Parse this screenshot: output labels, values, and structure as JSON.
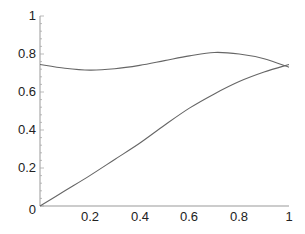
{
  "chart_data": {
    "type": "line",
    "title": "",
    "xlabel": "",
    "ylabel": "",
    "xlim": [
      0,
      1
    ],
    "ylim": [
      0,
      1
    ],
    "grid": false,
    "legend": null,
    "x_ticks": [
      "0.2",
      "0.4",
      "0.6",
      "0.8",
      "1"
    ],
    "y_ticks": [
      "0",
      "0.2",
      "0.4",
      "0.6",
      "0.8",
      "1"
    ],
    "x": [
      0,
      0.1,
      0.2,
      0.3,
      0.4,
      0.5,
      0.6,
      0.7,
      0.8,
      0.9,
      1.0
    ],
    "series": [
      {
        "name": "upper curve",
        "values": [
          0.745,
          0.725,
          0.715,
          0.722,
          0.74,
          0.765,
          0.79,
          0.808,
          0.8,
          0.775,
          0.73
        ]
      },
      {
        "name": "lower curve",
        "values": [
          0.0,
          0.08,
          0.16,
          0.245,
          0.33,
          0.425,
          0.515,
          0.59,
          0.655,
          0.705,
          0.745
        ]
      }
    ],
    "colors": {
      "axis": "#888888",
      "curve": "#666666",
      "text": "#222222"
    }
  },
  "axes": {
    "origin_label": "0",
    "x_labels": [
      "0.2",
      "0.4",
      "0.6",
      "0.8",
      "1"
    ],
    "y_labels": [
      "0.2",
      "0.4",
      "0.6",
      "0.8",
      "1"
    ]
  }
}
